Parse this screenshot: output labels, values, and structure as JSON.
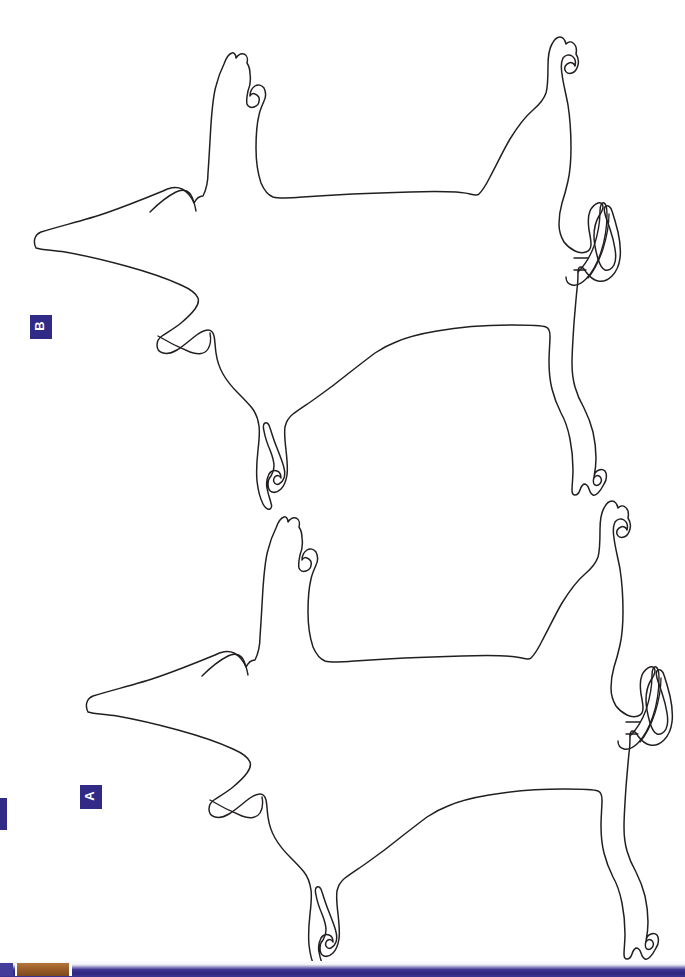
{
  "page": {
    "background_color": "#ffffff",
    "width": 685,
    "height": 977,
    "kind": "scanned-figure-page",
    "ink_color": "#231f20"
  },
  "panels": [
    {
      "id": "panel-b",
      "label": "B",
      "badge_color": "#312a86",
      "badge_text_color": "#ffffff",
      "badge_rotation_deg": -90,
      "subject": "pig-body-outline",
      "orientation": "rotated-90-clockwise",
      "position": "upper"
    },
    {
      "id": "panel-a",
      "label": "A",
      "badge_color": "#312a86",
      "badge_text_color": "#ffffff",
      "badge_rotation_deg": -90,
      "subject": "pig-body-outline",
      "orientation": "rotated-90-clockwise",
      "position": "lower"
    }
  ],
  "artifacts": {
    "left_edge_mark_color": "#312a86",
    "bottom_bar_color": "#312a86",
    "bottom_bar_tan_color": "#9b5f29",
    "bottom_bar_highlight_color": "#e8e7f3"
  },
  "figure_paths": {
    "pig_b": "M 36 248 C 33 242 34 235 41 232 C 60 226 86 220 106 213 C 126 206 146 198 163 191 C 168 188 176 186 182 189 C 188 192 192 198 194 203 C 196 199 199 196 203 196 C 206 190 208 182 208 173 C 209 160 210 140 211 124 C 212 110 213 96 216 86 C 218 78 221 70 224 64 C 226 58 229 54 232 53 C 234 52 236 55 236 58 C 238 55 241 53 244 54 C 247 55 248 59 247 63 C 249 66 250 70 250 74 C 251 80 250 86 248 91 C 247 96 246 100 247 104 C 248 107 251 108 254 107 C 257 106 259 104 259 101 C 260 98 258 95 255 94 C 253 93 251 94 250 96 C 250 92 252 88 255 86 C 258 84 262 85 264 88 C 266 92 266 97 264 101 C 262 106 260 110 259 115 C 257 123 256 135 256 148 C 256 162 258 174 261 183 C 264 190 268 195 273 197 C 280 199 291 198 303 197 C 330 195 372 193 410 192 C 440 191 462 192 470 194 C 474 195 477 196 479 194 C 482 191 486 185 490 177 C 496 166 503 151 510 139 C 518 126 526 116 533 110 C 540 104 544 99 546 93 C 548 86 548 76 548 66 C 548 57 549 49 552 44 C 554 40 557 37 560 37 C 563 37 565 40 566 44 C 568 42 571 41 573 43 C 576 45 577 49 576 54 C 578 57 579 61 578 65 C 577 69 575 72 572 73 C 569 74 566 73 565 70 C 564 67 566 64 569 63 C 571 62 574 63 575 66 C 576 62 575 58 572 56 C 569 54 565 55 563 58 C 561 62 561 68 562 74 C 563 83 566 94 568 105 C 570 118 571 133 571 148 C 571 160 570 172 568 181 C 566 190 564 197 562 203 C 560 210 559 217 559 224 C 559 231 561 237 564 242 C 567 246 571 249 575 251 C 579 253 583 253 586 252 C 589 251 591 248 591 244 C 591 240 590 235 589 230 C 588 223 588 216 590 211 C 592 207 595 204 598 203 C 601 202 603 204 603 207 C 603 210 601 213 599 216 C 596 221 594 228 594 236 C 594 244 596 252 598 259 C 600 265 602 269 605 270 C 608 271 612 269 614 265 C 616 261 616 255 615 249 C 614 242 612 235 610 229 C 608 223 606 218 605 214 C 604 210 604 207 606 206 C 608 205 611 207 612 211 C 614 217 616 224 618 232 C 620 241 621 250 620 258 C 619 266 616 272 612 276 C 608 280 603 282 598 281 C 593 280 589 276 586 272 C 584 269 583 267 581 267 C 579 267 578 269 578 272 C 578 277 578 283 577 289 C 576 299 575 311 574 323 C 573 338 572 352 572 363 C 572 372 573 380 575 387 C 577 394 580 401 584 408 C 588 416 591 424 593 432 C 595 441 596 450 596 458 C 596 466 595 472 594 477 C 593 481 593 484 595 485 C 597 486 600 485 601 482 C 602 480 601 477 599 476 C 597 475 595 476 594 478 C 594 474 596 471 599 470 C 602 469 605 470 606 473 C 607 477 606 481 604 484 C 602 488 600 491 598 493 C 596 495 595 496 593 495 C 591 494 590 492 589 489 C 588 486 586 484 584 484 C 582 485 581 487 580 490 C 579 493 577 495 575 495 C 573 495 572 493 572 490 C 572 485 573 478 573 470 C 573 460 572 449 570 439 C 568 429 565 420 561 413 C 557 405 554 397 552 389 C 550 381 549 372 549 362 C 549 352 550 343 550 336 C 550 331 549 328 546 327 C 541 325 529 325 512 325 C 489 325 459 327 437 331 C 419 334 405 338 396 342 C 388 345 381 349 375 353 C 367 359 358 366 349 373 C 338 382 326 391 316 398 C 306 405 298 410 293 414 C 288 418 286 422 285 427 C 284 433 285 441 286 450 C 287 459 288 468 287 475 C 286 481 284 486 281 489 C 278 492 275 493 272 492 C 269 491 268 488 268 484 C 268 481 269 478 271 476 C 273 473 274 470 274 466 C 274 461 272 455 270 450 C 267 443 265 437 264 431 C 263 427 263 424 265 423 C 267 422 269 424 270 428 C 272 434 274 441 277 448 C 280 456 283 463 284 468 C 285 472 285 475 284 478 C 283 481 281 483 279 484 C 277 485 275 484 274 482 C 273 480 274 477 276 476 C 278 475 280 476 281 478 C 281 475 280 472 277 471 C 274 470 271 471 269 474 C 267 478 266 483 267 488 C 268 494 270 499 271 503 C 272 506 272 508 270 509 C 268 510 265 508 263 504 C 260 498 258 490 257 481 C 256 470 257 459 258 450 C 259 441 260 433 259 426 C 258 419 256 413 252 408 C 248 403 243 398 238 393 C 232 387 227 381 223 374 C 219 367 217 360 216 353 C 215 346 215 340 214 336 C 213 332 211 330 208 330 C 204 330 199 333 194 337 C 188 342 182 347 177 350 C 172 353 167 354 163 353 C 159 352 157 349 157 345 C 157 341 159 338 162 336 C 168 332 175 328 181 323 C 187 318 192 313 195 309 C 198 305 199 301 198 298 C 196 293 190 289 181 285 C 168 279 148 272 126 266 C 104 260 82 255 65 252 C 52 250 42 250 36 248 Z",
    "pig_a": "M 88 712 C 85 706 86 699 93 696 C 112 690 138 684 158 677 C 178 670 198 662 215 655 C 220 652 228 650 234 653 C 240 656 244 662 246 667 C 248 663 251 660 255 660 C 258 654 260 646 260 637 C 261 624 262 604 263 588 C 264 574 265 560 268 550 C 270 542 273 534 276 528 C 278 522 281 518 284 517 C 286 516 288 519 288 522 C 290 519 293 517 296 518 C 299 519 300 523 299 527 C 301 530 302 534 302 538 C 303 544 302 550 300 555 C 299 560 298 564 299 568 C 300 571 303 572 306 571 C 309 570 311 568 311 565 C 312 562 310 559 307 558 C 305 557 303 558 302 560 C 302 556 304 552 307 550 C 310 548 314 549 316 552 C 318 556 318 561 316 565 C 314 570 312 574 311 579 C 309 587 308 599 308 612 C 308 626 310 638 313 647 C 316 654 320 659 325 661 C 332 663 343 662 355 661 C 382 659 424 657 462 656 C 492 655 514 656 522 658 C 526 659 529 660 531 658 C 534 655 538 649 542 641 C 548 630 555 615 562 603 C 570 590 578 580 585 574 C 592 568 596 563 598 557 C 600 550 600 540 600 530 C 600 521 601 513 604 508 C 606 504 609 501 612 501 C 615 501 617 504 618 508 C 620 506 623 505 625 507 C 628 509 629 513 628 518 C 630 521 631 525 630 529 C 629 533 627 536 624 537 C 621 538 618 537 617 534 C 616 531 618 528 621 527 C 623 526 626 527 627 530 C 628 526 627 522 624 520 C 621 518 617 519 615 522 C 613 526 613 532 614 538 C 615 547 618 558 620 569 C 622 582 623 597 623 612 C 623 624 622 636 620 645 C 618 654 616 661 614 667 C 612 674 611 681 611 688 C 611 695 613 701 616 706 C 619 710 623 713 627 715 C 631 717 635 717 638 716 C 641 715 643 712 643 708 C 643 704 642 699 641 694 C 640 687 640 680 642 675 C 644 671 647 668 650 667 C 653 666 655 668 655 671 C 655 674 653 677 651 680 C 648 685 646 692 646 700 C 646 708 648 716 650 723 C 652 729 654 733 657 734 C 660 735 664 733 666 729 C 668 725 668 719 667 713 C 666 706 664 699 662 693 C 660 687 658 682 657 678 C 656 674 656 671 658 670 C 660 669 663 671 664 675 C 666 681 668 688 670 696 C 672 705 673 714 672 722 C 671 730 668 736 664 740 C 660 744 655 746 650 745 C 645 744 641 740 638 736 C 636 733 635 731 633 731 C 631 731 630 733 630 736 C 630 741 630 747 629 753 C 628 763 627 775 626 787 C 625 802 624 816 624 827 C 624 836 625 844 627 851 C 629 858 632 865 636 872 C 640 880 643 888 645 896 C 647 905 648 914 648 922 C 648 930 647 936 646 941 C 645 945 645 948 647 949 C 649 950 652 949 653 946 C 654 944 653 941 651 940 C 649 939 647 940 646 942 C 646 938 648 935 651 934 C 654 933 657 934 658 937 C 659 941 658 945 656 948 C 654 952 652 955 650 957 C 648 959 647 960 645 959 C 643 958 642 956 641 953 C 640 950 638 948 636 948 C 634 949 633 951 632 954 C 631 957 629 959 627 959 C 625 959 624 957 624 954 C 624 949 625 942 625 934 C 625 924 624 913 622 903 C 620 893 617 884 613 877 C 609 869 606 861 604 853 C 602 845 601 836 601 826 C 601 816 602 807 602 800 C 602 795 601 792 598 791 C 593 789 581 789 564 789 C 541 789 511 791 489 795 C 471 798 457 802 448 806 C 440 809 433 813 427 817 C 419 823 410 830 401 837 C 390 846 378 855 368 862 C 358 869 350 874 345 878 C 340 882 338 886 337 891 C 336 897 337 905 338 914 C 339 923 340 932 339 939 C 338 945 336 950 333 953 C 330 956 327 957 324 956 C 321 955 320 952 320 948 C 320 945 321 942 323 940 C 325 937 326 934 326 930 C 326 925 324 919 322 914 C 319 907 317 901 316 895 C 315 891 315 888 317 887 C 319 886 321 888 322 892 C 324 898 326 905 329 912 C 332 920 335 927 336 932 C 337 936 337 939 336 942 C 335 945 333 947 331 948 C 329 949 327 948 326 946 C 325 944 326 941 328 940 C 330 939 332 940 333 942 C 333 939 332 936 329 935 C 326 934 323 935 321 938 C 319 942 318 947 319 952 C 320 958 322 963 323 967 C 324 970 324 972 322 973 C 320 974 317 972 315 968 C 312 962 310 954 309 945 C 308 934 309 923 310 914 C 311 905 312 897 311 890 C 310 883 308 877 304 872 C 300 867 295 862 290 857 C 284 851 279 845 275 838 C 271 831 269 824 268 817 C 267 810 267 804 266 800 C 265 796 263 794 260 794 C 256 794 251 797 246 801 C 240 806 234 811 229 814 C 224 817 219 818 215 817 C 211 816 209 813 209 809 C 209 805 211 802 214 800 C 220 796 227 792 233 787 C 239 782 244 777 247 773 C 250 769 251 765 250 762 C 248 757 242 753 233 749 C 220 743 200 736 178 730 C 156 724 134 719 117 716 C 104 714 94 714 88 712 Z"
  }
}
